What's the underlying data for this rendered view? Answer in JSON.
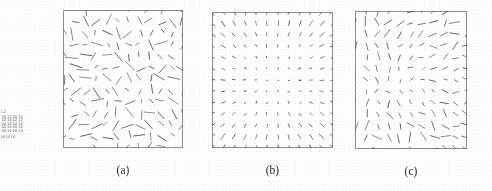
{
  "figure": {
    "kind": "vector-field-triptych",
    "background_color": "#fdfdfd",
    "stroke_color": "#4a4a4a",
    "frame_color": "#8e8e8e",
    "panels": [
      {
        "id": "a",
        "caption": "(a)",
        "x": 63,
        "y": 10,
        "width": 120,
        "height": 138,
        "grid_cols": 11,
        "grid_rows": 12,
        "regime": "disordered",
        "description": "Dense irregular field of line segments with strongly varying lengths and random orientations throughout the frame.",
        "mean_length": 8.2,
        "length_jitter": 0.55,
        "angle_mode": "random",
        "angle_jitter_deg": 180,
        "position_jitter": 2.4,
        "seed": 17
      },
      {
        "id": "b",
        "caption": "(b)",
        "x": 212,
        "y": 12,
        "width": 121,
        "height": 136,
        "grid_cols": 11,
        "grid_rows": 12,
        "regime": "ordered-radial",
        "description": "Highly regular field: magnitude near zero at the centre and growing smoothly outward, orientations aligned radially producing a clean symmetric pattern.",
        "mean_length": 4.6,
        "length_jitter": 0.12,
        "angle_mode": "radial",
        "angle_jitter_deg": 14,
        "position_jitter": 0.5,
        "seed": 41
      },
      {
        "id": "c",
        "caption": "(c)",
        "x": 355,
        "y": 11,
        "width": 112,
        "height": 138,
        "grid_cols": 10,
        "grid_rows": 12,
        "regime": "intermediate",
        "description": "Partially ordered field, intermediate between (a) and (b): moderate length variation with locally coherent but globally mixed orientations.",
        "mean_length": 6.6,
        "length_jitter": 0.38,
        "angle_mode": "mixed",
        "angle_jitter_deg": 95,
        "position_jitter": 1.5,
        "seed": 88
      }
    ]
  },
  "legend": {
    "title": "1.2",
    "rows": [
      [
        "0.0",
        "1.0",
        "0.0",
        "1.0"
      ],
      [
        "0.2",
        "1.0",
        "0.2",
        "1.0"
      ],
      [
        "0.4",
        "1.0",
        "0.4",
        "1.0"
      ],
      [
        "0.6",
        "1.0",
        "0.6",
        "1.0"
      ],
      [
        "0.8",
        "1.0",
        "0.8",
        "1.0"
      ]
    ],
    "footer": "0.0     1.0     1.0"
  }
}
